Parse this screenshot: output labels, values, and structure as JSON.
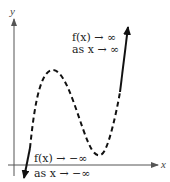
{
  "figure": {
    "axes": {
      "x_label": "x",
      "y_label": "y"
    },
    "annotations": {
      "right_end": {
        "line1": "f(x) → ∞",
        "line2": "as x → ∞"
      },
      "left_end": {
        "line1": "f(x) → −∞",
        "line2": "as x → −∞"
      }
    },
    "colors": {
      "curve": "#111111",
      "axes": "#555555",
      "background": "#ffffff"
    },
    "curve": {
      "description": "Cubic polynomial end behavior: dashed middle section with local maximum and local minimum; solid end segments with arrows",
      "local_max_px": [
        52,
        70
      ],
      "local_min_px": [
        99,
        155
      ],
      "left_arrow_tip_px": [
        24,
        178
      ],
      "right_arrow_tip_px": [
        128,
        26
      ]
    }
  }
}
